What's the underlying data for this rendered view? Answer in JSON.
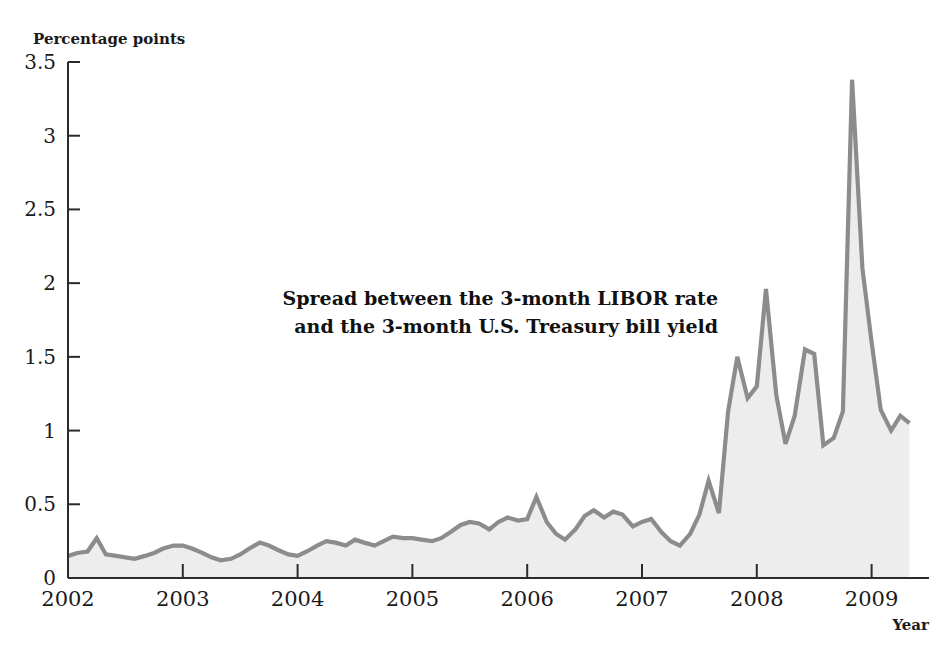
{
  "chart_data": {
    "type": "area",
    "title": "",
    "ylabel": "Percentage points",
    "xlabel": "Year",
    "ylim": [
      0,
      3.5
    ],
    "xlim": [
      2002.0,
      2009.5
    ],
    "grid": false,
    "legend_position": "none",
    "annotation": "Spread between the 3-month LIBOR rate\nand the 3-month U.S. Treasury bill yield",
    "annotation_line1": "Spread between the 3-month LIBOR rate",
    "annotation_line2": "and the 3-month U.S. Treasury bill yield",
    "y_ticks": [
      "0",
      "0.5",
      "1",
      "1.5",
      "2",
      "2.5",
      "3",
      "3.5"
    ],
    "y_tick_values": [
      0,
      0.5,
      1,
      1.5,
      2,
      2.5,
      3,
      3.5
    ],
    "x_ticks": [
      "2002",
      "2003",
      "2004",
      "2005",
      "2006",
      "2007",
      "2008",
      "2009"
    ],
    "x_tick_values": [
      2002,
      2003,
      2004,
      2005,
      2006,
      2007,
      2008,
      2009
    ],
    "line_color": "#8c8c8c",
    "fill_color": "#ededed",
    "series": [
      {
        "name": "Spread between the 3-month LIBOR rate and the 3-month U.S. Treasury bill yield",
        "x": [
          2002.0,
          2002.08,
          2002.17,
          2002.25,
          2002.33,
          2002.42,
          2002.5,
          2002.58,
          2002.67,
          2002.75,
          2002.83,
          2002.92,
          2003.0,
          2003.08,
          2003.17,
          2003.25,
          2003.33,
          2003.42,
          2003.5,
          2003.58,
          2003.67,
          2003.75,
          2003.83,
          2003.92,
          2004.0,
          2004.08,
          2004.17,
          2004.25,
          2004.33,
          2004.42,
          2004.5,
          2004.58,
          2004.67,
          2004.75,
          2004.83,
          2004.92,
          2005.0,
          2005.08,
          2005.17,
          2005.25,
          2005.33,
          2005.42,
          2005.5,
          2005.58,
          2005.67,
          2005.75,
          2005.83,
          2005.92,
          2006.0,
          2006.08,
          2006.17,
          2006.25,
          2006.33,
          2006.42,
          2006.5,
          2006.58,
          2006.67,
          2006.75,
          2006.83,
          2006.92,
          2007.0,
          2007.08,
          2007.17,
          2007.25,
          2007.33,
          2007.42,
          2007.5,
          2007.58,
          2007.67,
          2007.75,
          2007.83,
          2007.92,
          2008.0,
          2008.08,
          2008.17,
          2008.25,
          2008.33,
          2008.42,
          2008.5,
          2008.58,
          2008.67,
          2008.75,
          2008.83,
          2008.92,
          2009.0,
          2009.08,
          2009.17,
          2009.25,
          2009.33
        ],
        "values": [
          0.15,
          0.17,
          0.18,
          0.27,
          0.16,
          0.15,
          0.14,
          0.13,
          0.15,
          0.17,
          0.2,
          0.22,
          0.22,
          0.2,
          0.17,
          0.14,
          0.12,
          0.13,
          0.16,
          0.2,
          0.24,
          0.22,
          0.19,
          0.16,
          0.15,
          0.18,
          0.22,
          0.25,
          0.24,
          0.22,
          0.26,
          0.24,
          0.22,
          0.25,
          0.28,
          0.27,
          0.27,
          0.26,
          0.25,
          0.27,
          0.31,
          0.36,
          0.38,
          0.37,
          0.33,
          0.38,
          0.41,
          0.39,
          0.4,
          0.55,
          0.38,
          0.3,
          0.26,
          0.33,
          0.42,
          0.46,
          0.41,
          0.45,
          0.43,
          0.35,
          0.38,
          0.4,
          0.31,
          0.25,
          0.22,
          0.3,
          0.43,
          0.66,
          0.44,
          1.13,
          1.5,
          1.22,
          1.3,
          1.96,
          1.24,
          0.91,
          1.1,
          1.55,
          1.52,
          0.9,
          0.95,
          1.13,
          3.38,
          2.1,
          1.6,
          1.14,
          1.0,
          1.1,
          1.05
        ]
      }
    ]
  },
  "labels": {
    "y_axis_title": "Percentage points",
    "x_axis_title": "Year"
  }
}
